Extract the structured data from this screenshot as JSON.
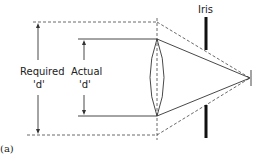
{
  "diagram": {
    "labels": {
      "iris": "Iris",
      "required": "Required",
      "required_d": "'d'",
      "actual": "Actual",
      "actual_d": "'d'",
      "caption": "(a)"
    },
    "colors": {
      "line": "#333333",
      "iris": "#111111",
      "background": "#ffffff"
    }
  }
}
